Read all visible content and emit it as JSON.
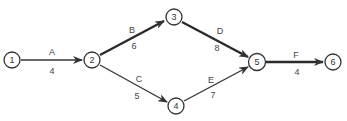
{
  "diagram": {
    "type": "activity-on-arrow network",
    "nodes": [
      {
        "id": "1",
        "label": "1",
        "x": 12,
        "y": 60
      },
      {
        "id": "2",
        "label": "2",
        "x": 92,
        "y": 60
      },
      {
        "id": "3",
        "label": "3",
        "x": 174,
        "y": 17
      },
      {
        "id": "4",
        "label": "4",
        "x": 176,
        "y": 106
      },
      {
        "id": "5",
        "label": "5",
        "x": 257,
        "y": 62
      },
      {
        "id": "6",
        "label": "6",
        "x": 333,
        "y": 62
      }
    ],
    "edges": [
      {
        "from": "1",
        "to": "2",
        "activity": "A",
        "duration": "4",
        "critical": true
      },
      {
        "from": "2",
        "to": "3",
        "activity": "B",
        "duration": "6",
        "critical": true
      },
      {
        "from": "2",
        "to": "4",
        "activity": "C",
        "duration": "5",
        "critical": false
      },
      {
        "from": "3",
        "to": "5",
        "activity": "D",
        "duration": "8",
        "critical": true
      },
      {
        "from": "4",
        "to": "5",
        "activity": "E",
        "duration": "7",
        "critical": false
      },
      {
        "from": "5",
        "to": "6",
        "activity": "F",
        "duration": "4",
        "critical": true
      }
    ]
  },
  "labels": {
    "n1": "1",
    "n2": "2",
    "n3": "3",
    "n4": "4",
    "n5": "5",
    "n6": "6",
    "A": "A",
    "A_dur": "4",
    "B": "B",
    "B_dur": "6",
    "C": "C",
    "C_dur": "5",
    "D": "D",
    "D_dur": "8",
    "E": "E",
    "E_dur": "7",
    "F": "F",
    "F_dur": "4"
  },
  "colors": {
    "line": "#333333",
    "critical_line": "#2a2a2a",
    "text": "#333333"
  }
}
